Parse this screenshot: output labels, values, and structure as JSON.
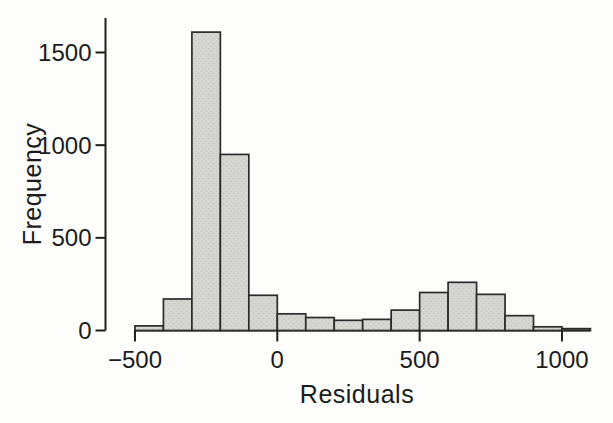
{
  "figure": {
    "background_color": "#fdfdfc",
    "bar_fill_color": "#d5d5d2",
    "bar_dot_color": "#bdbdba",
    "bar_border_color": "#2b2b2b",
    "axis_color": "#1e1e1e",
    "text_color": "#1b1b1b"
  },
  "chart_data": {
    "type": "bar",
    "subtype": "histogram",
    "title": "",
    "xlabel": "Residuals",
    "ylabel": "Frequency",
    "bin_width": 100,
    "bin_edges": [
      -500,
      -400,
      -300,
      -200,
      -100,
      0,
      100,
      200,
      300,
      400,
      500,
      600,
      700,
      800,
      900,
      1000,
      1100
    ],
    "counts": [
      25,
      170,
      1610,
      950,
      190,
      90,
      70,
      55,
      60,
      110,
      205,
      260,
      195,
      80,
      20,
      10
    ],
    "x_ticks": [
      -500,
      0,
      500,
      1000
    ],
    "x_tick_labels": [
      "−500",
      "0",
      "500",
      "1000"
    ],
    "y_ticks": [
      0,
      500,
      1000,
      1500
    ],
    "y_tick_labels": [
      "0",
      "500",
      "1000",
      "1500"
    ],
    "xlim": [
      -500,
      1100
    ],
    "ylim": [
      0,
      1685
    ],
    "grid": false,
    "legend": "none"
  }
}
